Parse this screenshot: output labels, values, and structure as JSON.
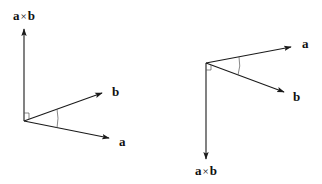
{
  "figure_left": {
    "title": "Right-hand rule: a × b points up",
    "origin": [
      24,
      121
    ],
    "vectors": {
      "cross": {
        "label_a": "a",
        "label_op": "×",
        "label_b": "b",
        "tip": [
          24,
          28
        ],
        "label_pos": [
          13,
          20
        ]
      },
      "b": {
        "label": "b",
        "tip": [
          103,
          93
        ],
        "label_pos": [
          112,
          96
        ]
      },
      "a": {
        "label": "a",
        "tip": [
          110,
          138
        ],
        "label_pos": [
          119,
          146
        ]
      }
    }
  },
  "figure_right": {
    "title": "Swapped orientation: a × b points down",
    "origin": [
      206,
      63
    ],
    "vectors": {
      "a": {
        "label": "a",
        "tip": [
          292,
          47
        ],
        "label_pos": [
          302,
          48
        ]
      },
      "b": {
        "label": "b",
        "tip": [
          285,
          92
        ],
        "label_pos": [
          293,
          101
        ]
      },
      "cross": {
        "label_a": "a",
        "label_op": "×",
        "label_b": "b",
        "tip": [
          206,
          160
        ],
        "label_pos": [
          195,
          175
        ]
      }
    }
  },
  "colors": {
    "stroke": "#1a1a1a",
    "background": "#ffffff"
  }
}
